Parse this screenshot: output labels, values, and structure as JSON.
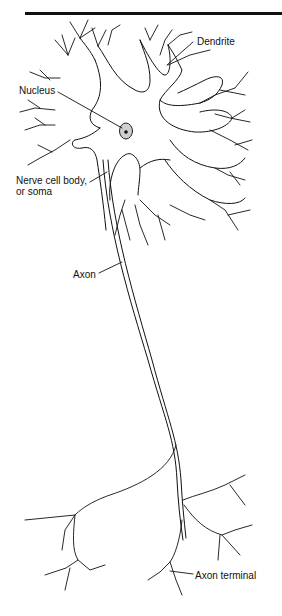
{
  "diagram": {
    "labels": {
      "dendrite": "Dendrite",
      "nucleus": "Nucleus",
      "soma_line1": "Nerve cell body,",
      "soma_line2": "or soma",
      "axon": "Axon",
      "axon_terminal": "Axon terminal"
    },
    "colors": {
      "line": "#111111",
      "background": "#ffffff",
      "nucleus_fill": "#cfcfcf"
    }
  }
}
